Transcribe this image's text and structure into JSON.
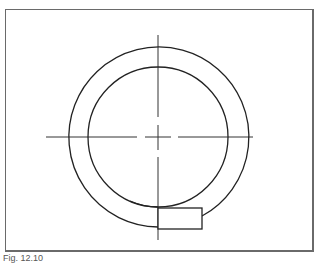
{
  "figure": {
    "caption": "Fig. 12.10",
    "colors": {
      "stroke": "#222222",
      "frame": "#6a6a6a",
      "background": "#ffffff"
    },
    "center": {
      "x": 158,
      "y": 137
    },
    "inner_radius": 70,
    "outer_radius": 90,
    "tab_rect": {
      "x": 158,
      "y": 208,
      "width": 44,
      "height": 21
    }
  }
}
